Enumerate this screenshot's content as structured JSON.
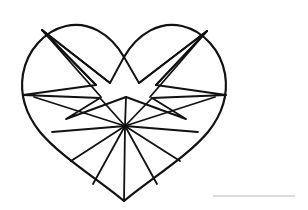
{
  "page": {
    "background_color": "#ffffff",
    "width": 308,
    "height": 210
  },
  "artwork": {
    "name": "heart-with-star-line-drawing",
    "description": "Black outline drawing of a heart filled with an eight-pointed star and radiating fan lines",
    "stroke_color": "#111111",
    "fill_color": "#ffffff",
    "outline_stroke_width": 2.2,
    "inner_stroke_width": 1.8,
    "heart_outline_path": "M 124 201 C 96 178 60 156 40 132 C 24 112 20 92 23 74 C 27 51 44 31 66 26 C 88 21 110 33 124 57 C 138 33 160 21 182 26 C 204 31 221 51 225 74 C 228 92 224 112 208 132 C 188 156 152 178 124 201 Z",
    "star_path": "M 124 57 L 139 83 L 207 31 L 156 85 L 226 95 L 152 98 L 186 119 L 126 97 L 66 119 L 100 98 L 23 95 L 96 85 L 42 30 L 110 83 Z",
    "upper_left_fan": [
      "M 42 30 L 96 85",
      "M 42 30 L 110 83",
      "M 42 30 L 101 97"
    ],
    "upper_right_fan": [
      "M 207 31 L 156 85",
      "M 207 31 L 139 83",
      "M 207 31 L 150 97"
    ],
    "star_left_point_edge": "M 23 95 L 96 85",
    "star_right_point_edge": "M 226 95 L 152 85",
    "lower_fan_hub": {
      "x": 125,
      "y": 126
    },
    "lower_fan_rays": [
      "M 125 126 L 34 97",
      "M 125 126 L 52 132",
      "M 125 126 L 71 161",
      "M 125 126 L 93 184",
      "M 125 126 L 124 201",
      "M 125 126 L 157 184",
      "M 125 126 L 180 161",
      "M 125 126 L 198 132",
      "M 125 126 L 215 97"
    ],
    "star_to_hub_connectors": [
      "M 126 97 L 125 126",
      "M 100 98 L 125 126",
      "M 152 98 L 125 126"
    ]
  },
  "footer_rule": {
    "name": "horizontal-rule",
    "color": "#b9b9b9",
    "x1": 213,
    "y1": 196,
    "x2": 295,
    "y2": 196
  }
}
